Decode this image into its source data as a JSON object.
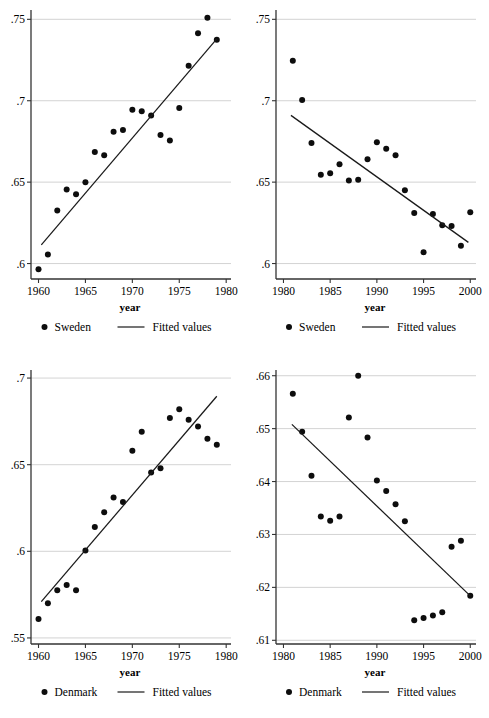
{
  "figure": {
    "title": "",
    "panel_count": 4
  },
  "chart_data": [
    {
      "id": "sweden-1960-1979",
      "type": "scatter",
      "title": "",
      "xlabel": "year",
      "ylabel": "",
      "xlim": [
        1959.2,
        1980.3
      ],
      "ylim": [
        0.5905,
        0.7545
      ],
      "xticks": [
        1960,
        1965,
        1970,
        1975,
        1980
      ],
      "xticklabels": [
        "1960",
        "1965",
        "1970",
        "1975",
        "1980"
      ],
      "yticks": [
        0.6,
        0.65,
        0.7,
        0.75
      ],
      "yticklabels": [
        ".6",
        ".65",
        ".7",
        ".75"
      ],
      "grid": "horizontal",
      "legend": {
        "position": "below",
        "entries": [
          {
            "label": "Sweden",
            "marker": "circle"
          },
          {
            "label": "Fitted values",
            "marker": "line"
          }
        ]
      },
      "series": [
        {
          "name": "Sweden",
          "kind": "points",
          "x": [
            1960,
            1961,
            1962,
            1963,
            1964,
            1965,
            1966,
            1967,
            1968,
            1969,
            1970,
            1971,
            1972,
            1973,
            1974,
            1975,
            1976,
            1977,
            1978,
            1979
          ],
          "y": [
            0.5965,
            0.6055,
            0.6325,
            0.6455,
            0.6425,
            0.65,
            0.6685,
            0.6665,
            0.681,
            0.682,
            0.6945,
            0.6935,
            0.691,
            0.679,
            0.6755,
            0.6955,
            0.7215,
            0.7415,
            0.751,
            0.7375
          ]
        },
        {
          "name": "Fitted values",
          "kind": "line",
          "x": [
            1960.3,
            1979.0
          ],
          "y": [
            0.6115,
            0.738
          ]
        }
      ]
    },
    {
      "id": "sweden-1981-2000",
      "type": "scatter",
      "title": "",
      "xlabel": "year",
      "ylabel": "",
      "xlim": [
        1979.2,
        2000.4
      ],
      "ylim": [
        0.5905,
        0.7545
      ],
      "xticks": [
        1980,
        1985,
        1990,
        1995,
        2000
      ],
      "xticklabels": [
        "1980",
        "1985",
        "1990",
        "1995",
        "2000"
      ],
      "yticks": [
        0.6,
        0.65,
        0.7,
        0.75
      ],
      "yticklabels": [
        ".6",
        ".65",
        ".7",
        ".75"
      ],
      "grid": "horizontal",
      "legend": {
        "position": "below",
        "entries": [
          {
            "label": "Sweden",
            "marker": "circle"
          },
          {
            "label": "Fitted values",
            "marker": "line"
          }
        ]
      },
      "series": [
        {
          "name": "Sweden",
          "kind": "points",
          "x": [
            1981,
            1982,
            1983,
            1984,
            1985,
            1986,
            1987,
            1988,
            1989,
            1990,
            1991,
            1992,
            1993,
            1994,
            1995,
            1996,
            1997,
            1998,
            1999,
            2000
          ],
          "y": [
            0.7245,
            0.7005,
            0.674,
            0.6545,
            0.6555,
            0.661,
            0.651,
            0.6515,
            0.664,
            0.6745,
            0.6705,
            0.6665,
            0.645,
            0.631,
            0.607,
            0.6305,
            0.6235,
            0.623,
            0.611,
            0.6315
          ]
        },
        {
          "name": "Fitted values",
          "kind": "line",
          "x": [
            1980.8,
            1999.8
          ],
          "y": [
            0.691,
            0.613
          ]
        }
      ]
    },
    {
      "id": "denmark-1960-1979",
      "type": "scatter",
      "title": "",
      "xlabel": "year",
      "ylabel": "",
      "xlim": [
        1959.2,
        1980.3
      ],
      "ylim": [
        0.5465,
        0.7035
      ],
      "xticks": [
        1960,
        1965,
        1970,
        1975,
        1980
      ],
      "xticklabels": [
        "1960",
        "1965",
        "1970",
        "1975",
        "1980"
      ],
      "yticks": [
        0.55,
        0.6,
        0.65,
        0.7
      ],
      "yticklabels": [
        ".55",
        ".6",
        ".65",
        ".7"
      ],
      "grid": "horizontal",
      "legend": {
        "position": "below",
        "entries": [
          {
            "label": "Denmark",
            "marker": "circle"
          },
          {
            "label": "Fitted values",
            "marker": "line"
          }
        ]
      },
      "series": [
        {
          "name": "Denmark",
          "kind": "points",
          "x": [
            1960,
            1961,
            1962,
            1963,
            1964,
            1965,
            1966,
            1967,
            1968,
            1969,
            1970,
            1971,
            1972,
            1973,
            1974,
            1975,
            1976,
            1977,
            1978,
            1979
          ],
          "y": [
            0.561,
            0.57,
            0.5775,
            0.5805,
            0.5775,
            0.6005,
            0.614,
            0.6225,
            0.631,
            0.6285,
            0.658,
            0.669,
            0.6455,
            0.648,
            0.677,
            0.682,
            0.676,
            0.672,
            0.665,
            0.6615
          ]
        },
        {
          "name": "Fitted values",
          "kind": "line",
          "x": [
            1960.3,
            1979.0
          ],
          "y": [
            0.571,
            0.6895
          ]
        }
      ]
    },
    {
      "id": "denmark-1981-2000",
      "type": "scatter",
      "title": "",
      "xlabel": "year",
      "ylabel": "",
      "xlim": [
        1979.2,
        2000.4
      ],
      "ylim": [
        0.6093,
        0.6607
      ],
      "xticks": [
        1980,
        1985,
        1990,
        1995,
        2000
      ],
      "xticklabels": [
        "1980",
        "1985",
        "1990",
        "1995",
        "2000"
      ],
      "yticks": [
        0.61,
        0.62,
        0.63,
        0.64,
        0.65,
        0.66
      ],
      "yticklabels": [
        ".61",
        ".62",
        ".63",
        ".64",
        ".65",
        ".66"
      ],
      "grid": "horizontal",
      "legend": {
        "position": "below",
        "entries": [
          {
            "label": "Denmark",
            "marker": "circle"
          },
          {
            "label": "Fitted values",
            "marker": "line"
          }
        ]
      },
      "series": [
        {
          "name": "Denmark",
          "kind": "points",
          "x": [
            1981,
            1982,
            1983,
            1984,
            1985,
            1986,
            1987,
            1988,
            1989,
            1990,
            1991,
            1992,
            1993,
            1994,
            1995,
            1996,
            1997,
            1998,
            1999,
            2000
          ],
          "y": [
            0.6566,
            0.6494,
            0.6411,
            0.6334,
            0.6326,
            0.6334,
            0.6521,
            0.66,
            0.6483,
            0.6402,
            0.6382,
            0.6357,
            0.6325,
            0.6138,
            0.6142,
            0.6147,
            0.6153,
            0.6277,
            0.6288,
            0.6184
          ]
        },
        {
          "name": "Fitted values",
          "kind": "line",
          "x": [
            1980.9,
            2000.0
          ],
          "y": [
            0.6508,
            0.6184
          ]
        }
      ]
    }
  ],
  "colors": {
    "marker": "#0d0d0d",
    "fitline": "#1a1a1a",
    "grid": "#c8c8c8",
    "axis": "#333333",
    "background": "#ffffff"
  }
}
